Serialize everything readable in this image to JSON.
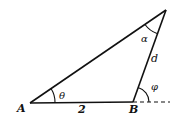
{
  "figure": {
    "type": "triangle",
    "vertices": {
      "A": {
        "label": "A",
        "x": 30,
        "y": 103
      },
      "B": {
        "label": "B",
        "x": 133,
        "y": 102
      },
      "C": {
        "label": "",
        "x": 166,
        "y": 10
      }
    },
    "side_labels": {
      "AB": "2",
      "BC": "d"
    },
    "angle_labels": {
      "at_A": "θ",
      "at_C": "α",
      "exterior_at_B": "φ"
    },
    "colors": {
      "stroke": "#111111",
      "background": "#ffffff"
    }
  }
}
